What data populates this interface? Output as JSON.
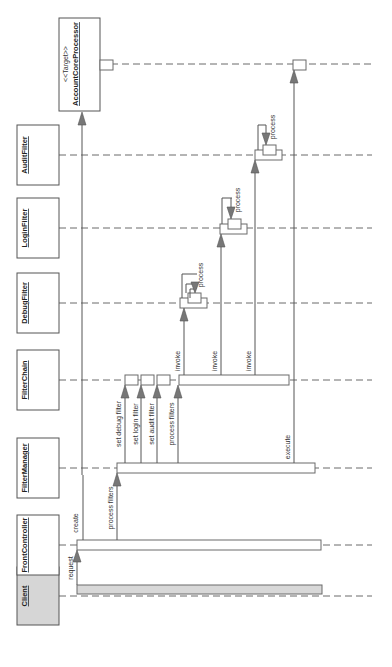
{
  "diagram": {
    "type": "UML sequence diagram (rotated 90° counter-clockwise)",
    "participants": [
      {
        "id": "client",
        "name": "Client",
        "stereotype": ""
      },
      {
        "id": "frontcontroller",
        "name": "FrontController",
        "stereotype": ""
      },
      {
        "id": "filtermanager",
        "name": "FilterManager",
        "stereotype": ""
      },
      {
        "id": "filterchain",
        "name": "FilterChain",
        "stereotype": ""
      },
      {
        "id": "debugfilter",
        "name": "DebugFilter",
        "stereotype": ""
      },
      {
        "id": "loginfilter",
        "name": "LoginFilter",
        "stereotype": ""
      },
      {
        "id": "auditfilter",
        "name": "AuditFilter",
        "stereotype": ""
      },
      {
        "id": "target",
        "name": "AccountCoreProcessor",
        "stereotype": "<<Target>>"
      }
    ],
    "messages": [
      {
        "from": "Client",
        "to": "FrontController",
        "label": "request"
      },
      {
        "from": "FrontController",
        "to": "FilterManager",
        "label": "create"
      },
      {
        "from": "FrontController",
        "to": "FilterManager",
        "label": "process filters"
      },
      {
        "from": "FilterManager",
        "to": "FilterChain",
        "label": "set debug filter"
      },
      {
        "from": "FilterManager",
        "to": "FilterChain",
        "label": "set login filter"
      },
      {
        "from": "FilterManager",
        "to": "FilterChain",
        "label": "set audit filter"
      },
      {
        "from": "FilterManager",
        "to": "FilterChain",
        "label": "process filters"
      },
      {
        "from": "FilterChain",
        "to": "DebugFilter",
        "label": "invoke"
      },
      {
        "from": "DebugFilter",
        "to": "DebugFilter",
        "label": "process"
      },
      {
        "from": "FilterChain",
        "to": "LoginFilter",
        "label": "invoke"
      },
      {
        "from": "LoginFilter",
        "to": "LoginFilter",
        "label": "process"
      },
      {
        "from": "FilterChain",
        "to": "AuditFilter",
        "label": "invoke"
      },
      {
        "from": "AuditFilter",
        "to": "AuditFilter",
        "label": "process"
      },
      {
        "from": "FilterManager",
        "to": "AccountCoreProcessor",
        "label": "execute"
      }
    ]
  },
  "colors": {
    "client_fill": "#d6d6d6",
    "line": "#555555",
    "arrowhead": "#777777"
  }
}
